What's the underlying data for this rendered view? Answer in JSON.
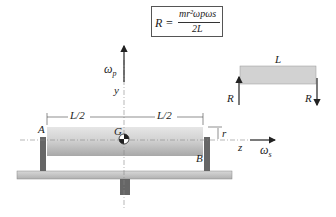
{
  "formula": {
    "lhs": "R =",
    "numerator": "mr²ωpωs",
    "denominator": "2L"
  },
  "labels": {
    "omega_p": "ω",
    "omega_p_sub": "p",
    "y_axis": "y",
    "z_axis": "z",
    "omega_s": "ω",
    "omega_s_sub": "s",
    "half_length_left": "L/2",
    "half_length_right": "L/2",
    "center_of_mass": "G",
    "bearing_a": "A",
    "bearing_b": "B",
    "radius": "r"
  },
  "free_body": {
    "length_label": "L",
    "reaction_left": "R",
    "reaction_right": "R"
  },
  "colors": {
    "cylinder": "#c8c8c8",
    "bearing": "#666666",
    "base": "#c4c4c4",
    "line": "#333333"
  }
}
